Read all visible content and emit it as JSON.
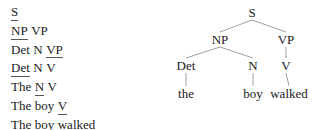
{
  "derivation": {
    "steps": [
      {
        "tokens": [
          {
            "t": "S",
            "u": true
          }
        ]
      },
      {
        "tokens": [
          {
            "t": "NP",
            "u": true
          },
          {
            "t": "VP",
            "u": false
          }
        ]
      },
      {
        "tokens": [
          {
            "t": "Det",
            "u": false
          },
          {
            "t": "N",
            "u": false
          },
          {
            "t": "VP",
            "u": true
          }
        ]
      },
      {
        "tokens": [
          {
            "t": "Det",
            "u": true
          },
          {
            "t": "N",
            "u": false
          },
          {
            "t": "V",
            "u": false
          }
        ]
      },
      {
        "tokens": [
          {
            "t": "The",
            "u": false
          },
          {
            "t": "N",
            "u": true
          },
          {
            "t": "V",
            "u": false
          }
        ]
      },
      {
        "tokens": [
          {
            "t": "The",
            "u": false
          },
          {
            "t": "boy",
            "u": false
          },
          {
            "t": "V",
            "u": true
          }
        ]
      },
      {
        "tokens": [
          {
            "t": "The",
            "u": false
          },
          {
            "t": "boy",
            "u": false
          },
          {
            "t": "walked",
            "u": false
          }
        ]
      }
    ]
  },
  "tree": {
    "nodes": [
      {
        "id": "S",
        "label": "S"
      },
      {
        "id": "NP",
        "label": "NP"
      },
      {
        "id": "VP",
        "label": "VP"
      },
      {
        "id": "Det",
        "label": "Det"
      },
      {
        "id": "N",
        "label": "N"
      },
      {
        "id": "V",
        "label": "V"
      },
      {
        "id": "the",
        "label": "the"
      },
      {
        "id": "boy",
        "label": "boy"
      },
      {
        "id": "walked",
        "label": "walked"
      }
    ],
    "edges": [
      [
        "S",
        "NP"
      ],
      [
        "S",
        "VP"
      ],
      [
        "NP",
        "Det"
      ],
      [
        "NP",
        "N"
      ],
      [
        "VP",
        "V"
      ],
      [
        "Det",
        "the"
      ],
      [
        "N",
        "boy"
      ],
      [
        "V",
        "walked"
      ]
    ]
  }
}
